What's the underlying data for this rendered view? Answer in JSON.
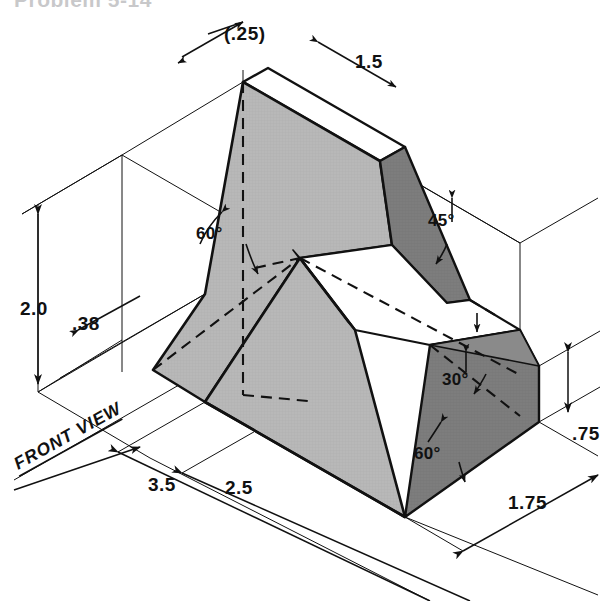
{
  "page": {
    "title_fragment": "Problem 5-14",
    "background_color": "#ffffff",
    "width": 610,
    "height": 601
  },
  "drawing": {
    "type": "isometric-pictorial",
    "view_label": "FRONT VIEW",
    "line_color": "#111111",
    "face_colors": {
      "front_light_gray": "#b8b8b8",
      "side_dark_gray": "#7d7d7d",
      "cut_white": "#ffffff"
    }
  },
  "dimensions": [
    {
      "id": "top-depth",
      "label": "(.25)",
      "kind": "linear",
      "unit": "in"
    },
    {
      "id": "top-width",
      "label": "1.5",
      "kind": "linear",
      "unit": "in"
    },
    {
      "id": "overall-height",
      "label": "2.0",
      "kind": "linear",
      "unit": "in"
    },
    {
      "id": "base-thickness",
      "label": ".38",
      "kind": "linear",
      "unit": "in"
    },
    {
      "id": "overall-length",
      "label": "3.5",
      "kind": "linear",
      "unit": "in"
    },
    {
      "id": "slot-length",
      "label": "2.5",
      "kind": "linear",
      "unit": "in"
    },
    {
      "id": "right-height",
      "label": ".75",
      "kind": "linear",
      "unit": "in"
    },
    {
      "id": "overall-depth",
      "label": "1.75",
      "kind": "linear",
      "unit": "in"
    }
  ],
  "angles": [
    {
      "id": "angle-left-60",
      "label": "60°"
    },
    {
      "id": "angle-right-45",
      "label": "45°"
    },
    {
      "id": "angle-front-30",
      "label": "30°"
    },
    {
      "id": "angle-front-60",
      "label": "60°"
    }
  ]
}
